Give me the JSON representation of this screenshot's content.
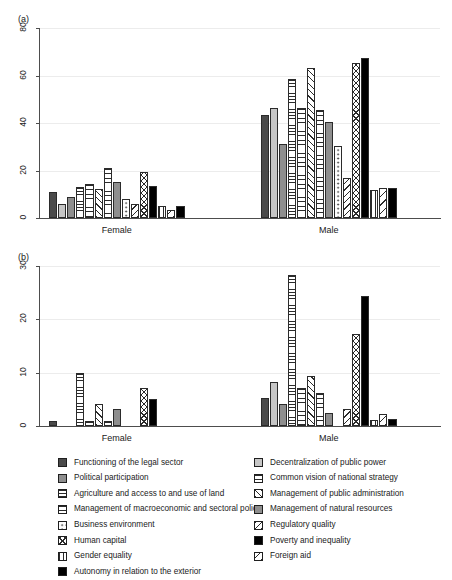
{
  "figure": {
    "panels": [
      {
        "tag": "(a)",
        "ylim": [
          0,
          80
        ],
        "yticks": [
          0,
          20,
          40,
          60,
          80
        ]
      },
      {
        "tag": "(b)",
        "ylim": [
          0,
          30
        ],
        "yticks": [
          0,
          10,
          20,
          30
        ]
      }
    ],
    "groups": [
      "Female",
      "Male"
    ]
  },
  "legend": {
    "left": [
      {
        "label": "Functioning of the legal sector",
        "pattern": "p-darkgray"
      },
      {
        "label": "Political participation",
        "pattern": "p-midgray"
      },
      {
        "label": "Agriculture and access to and use of land",
        "pattern": "p-hline"
      },
      {
        "label": "Management of macroeconomic and sectoral policy",
        "pattern": "p-hline2"
      },
      {
        "label": "Business environment",
        "pattern": "p-dots"
      },
      {
        "label": "Human capital",
        "pattern": "p-cross"
      },
      {
        "label": "Gender equality",
        "pattern": "p-vline"
      },
      {
        "label": "Autonomy in relation to the exterior",
        "pattern": "p-black"
      }
    ],
    "right": [
      {
        "label": "Decentralization of public power",
        "pattern": "p-lightgray"
      },
      {
        "label": "Common vision of national strategy",
        "pattern": "p-hline2"
      },
      {
        "label": "Management of public administration",
        "pattern": "p-bdiag"
      },
      {
        "label": "Management of natural resources",
        "pattern": "p-midgray"
      },
      {
        "label": "Regulatory quality",
        "pattern": "p-fdiag"
      },
      {
        "label": "Poverty and inequality",
        "pattern": "p-black"
      },
      {
        "label": "Foreign aid",
        "pattern": "p-fdiag2"
      }
    ]
  },
  "chart_data": [
    {
      "type": "bar",
      "title": "(a)",
      "xlabel": "",
      "ylabel": "",
      "ylim": [
        0,
        80
      ],
      "yticks": [
        0,
        20,
        40,
        60,
        80
      ],
      "grid": true,
      "legend_position": "bottom",
      "categories": [
        "Female",
        "Male"
      ],
      "series": [
        {
          "name": "Functioning of the legal sector",
          "pattern": "p-darkgray",
          "values": [
            11.0,
            43.2
          ]
        },
        {
          "name": "Decentralization of public power",
          "pattern": "p-lightgray",
          "values": [
            6.0,
            46.2
          ]
        },
        {
          "name": "Political participation",
          "pattern": "p-midgray",
          "values": [
            9.0,
            31.2
          ]
        },
        {
          "name": "Agriculture and access to and use of land",
          "pattern": "p-hline",
          "values": [
            13.2,
            58.5
          ]
        },
        {
          "name": "Common vision of national strategy",
          "pattern": "p-hline2",
          "values": [
            14.2,
            46.4
          ]
        },
        {
          "name": "Management of public administration",
          "pattern": "p-bdiag",
          "values": [
            12.1,
            63.2
          ]
        },
        {
          "name": "Management of macroeconomic and sectoral policy",
          "pattern": "p-hline2",
          "values": [
            21.0,
            45.4
          ]
        },
        {
          "name": "Management of natural resources",
          "pattern": "p-midgray",
          "values": [
            15.3,
            40.5
          ]
        },
        {
          "name": "Business environment",
          "pattern": "p-dots",
          "values": [
            8.2,
            30.4
          ]
        },
        {
          "name": "Regulatory quality",
          "pattern": "p-fdiag",
          "values": [
            6.1,
            16.7
          ]
        },
        {
          "name": "Human capital",
          "pattern": "p-cross",
          "values": [
            19.3,
            65.3
          ]
        },
        {
          "name": "Poverty and inequality",
          "pattern": "p-black",
          "values": [
            13.3,
            67.4
          ]
        },
        {
          "name": "Gender equality",
          "pattern": "p-vline",
          "values": [
            5.1,
            11.7
          ]
        },
        {
          "name": "Foreign aid",
          "pattern": "p-fdiag2",
          "values": [
            3.2,
            12.5
          ]
        },
        {
          "name": "Autonomy in relation to the exterior",
          "pattern": "p-black",
          "values": [
            5.2,
            12.6
          ]
        }
      ]
    },
    {
      "type": "bar",
      "title": "(b)",
      "xlabel": "",
      "ylabel": "",
      "ylim": [
        0,
        30
      ],
      "yticks": [
        0,
        10,
        20,
        30
      ],
      "grid": true,
      "legend_position": "bottom",
      "categories": [
        "Female",
        "Male"
      ],
      "series": [
        {
          "name": "Functioning of the legal sector",
          "pattern": "p-darkgray",
          "values": [
            1.0,
            5.2
          ]
        },
        {
          "name": "Decentralization of public power",
          "pattern": "p-lightgray",
          "values": [
            0.0,
            8.2
          ]
        },
        {
          "name": "Political participation",
          "pattern": "p-midgray",
          "values": [
            0.0,
            4.2
          ]
        },
        {
          "name": "Agriculture and access to and use of land",
          "pattern": "p-hline",
          "values": [
            10.0,
            28.3
          ]
        },
        {
          "name": "Common vision of national strategy",
          "pattern": "p-hline2",
          "values": [
            1.0,
            7.2
          ]
        },
        {
          "name": "Management of public administration",
          "pattern": "p-bdiag",
          "values": [
            4.1,
            9.3
          ]
        },
        {
          "name": "Management of macroeconomic and sectoral policy",
          "pattern": "p-hline2",
          "values": [
            1.0,
            6.2
          ]
        },
        {
          "name": "Management of natural resources",
          "pattern": "p-midgray",
          "values": [
            3.1,
            2.4
          ]
        },
        {
          "name": "Business environment",
          "pattern": "p-dots",
          "values": [
            0.0,
            0.0
          ]
        },
        {
          "name": "Regulatory quality",
          "pattern": "p-fdiag",
          "values": [
            0.0,
            3.2
          ]
        },
        {
          "name": "Human capital",
          "pattern": "p-cross",
          "values": [
            7.1,
            17.3
          ]
        },
        {
          "name": "Poverty and inequality",
          "pattern": "p-black",
          "values": [
            5.1,
            24.3
          ]
        },
        {
          "name": "Gender equality",
          "pattern": "p-vline",
          "values": [
            0.0,
            1.2
          ]
        },
        {
          "name": "Foreign aid",
          "pattern": "p-fdiag2",
          "values": [
            0.0,
            2.3
          ]
        },
        {
          "name": "Autonomy in relation to the exterior",
          "pattern": "p-black",
          "values": [
            0.0,
            1.3
          ]
        }
      ]
    }
  ]
}
